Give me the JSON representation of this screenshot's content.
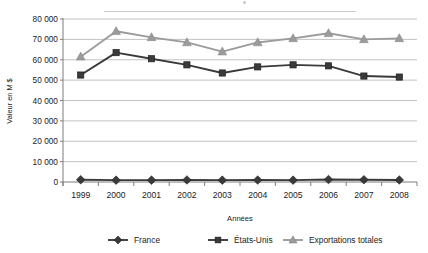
{
  "chart_data": {
    "type": "line",
    "title": "",
    "xlabel": "Années",
    "ylabel": "Valeur en M $",
    "categories": [
      "1999",
      "2000",
      "2001",
      "2002",
      "2003",
      "2004",
      "2005",
      "2006",
      "2007",
      "2008"
    ],
    "ylim": [
      0,
      80000
    ],
    "ytick_labels": [
      "0",
      "10 000",
      "20 000",
      "30 000",
      "40 000",
      "50 000",
      "60 000",
      "70 000",
      "80 000"
    ],
    "ytick_values": [
      0,
      10000,
      20000,
      30000,
      40000,
      50000,
      60000,
      70000,
      80000
    ],
    "grid": true,
    "legend_position": "bottom",
    "series": [
      {
        "name": "France",
        "marker": "diamond",
        "color": "#3a3a3a",
        "values": [
          1100,
          900,
          900,
          1000,
          900,
          950,
          900,
          1200,
          1100,
          1000
        ]
      },
      {
        "name": "États-Unis",
        "marker": "square",
        "color": "#3a3a3a",
        "values": [
          52500,
          63500,
          60500,
          57500,
          53500,
          56500,
          57500,
          57000,
          52000,
          51500
        ]
      },
      {
        "name": "Exportations totales",
        "marker": "triangle",
        "color": "#9b9b9b",
        "values": [
          61500,
          74000,
          71000,
          68500,
          64000,
          68500,
          70500,
          73000,
          70000,
          70500
        ]
      }
    ]
  },
  "axes": {
    "x_label": "Années",
    "y_label": "Valeur en M $"
  },
  "legend": {
    "items": [
      {
        "label": "France",
        "marker": "diamond-marker",
        "color": "#3a3a3a"
      },
      {
        "label": "États-Unis",
        "marker": "square-marker",
        "color": "#3a3a3a"
      },
      {
        "label": "Exportations totales",
        "marker": "triangle-marker",
        "color": "#9b9b9b"
      }
    ]
  }
}
